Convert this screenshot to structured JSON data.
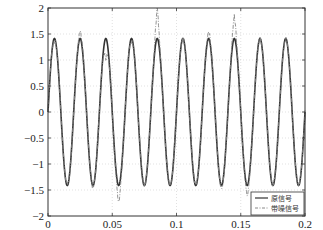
{
  "chart_data": {
    "type": "line",
    "title": "",
    "xlabel": "",
    "ylabel": "",
    "xlim": [
      0,
      0.2
    ],
    "ylim": [
      -2,
      2
    ],
    "grid": true,
    "legend_position": "lower right",
    "xticks": [
      "0",
      "0.05",
      "0.1",
      "0.15",
      "0.2"
    ],
    "yticks": [
      "2",
      "1.5",
      "1",
      "0.5",
      "0",
      "-0.5",
      "-1",
      "-1.5",
      "-2"
    ],
    "series": [
      {
        "name": "原信号",
        "style": "solid",
        "color": "#333333",
        "description": "sine wave, amplitude ~1.414, frequency 50 Hz",
        "amplitude": 1.414,
        "frequency_hz": 50,
        "x": [
          0,
          0.005,
          0.01,
          0.015,
          0.02,
          0.025,
          0.03,
          0.035,
          0.04,
          0.045,
          0.05,
          0.055,
          0.06,
          0.065,
          0.07,
          0.075,
          0.08,
          0.085,
          0.09,
          0.095,
          0.1,
          0.105,
          0.11,
          0.115,
          0.12,
          0.125,
          0.13,
          0.135,
          0.14,
          0.145,
          0.15,
          0.155,
          0.16,
          0.165,
          0.17,
          0.175,
          0.18,
          0.185,
          0.19,
          0.195,
          0.2
        ],
        "values": [
          0,
          1.41,
          0,
          -1.41,
          0,
          1.41,
          0,
          -1.41,
          0,
          1.41,
          0,
          -1.41,
          0,
          1.41,
          0,
          -1.41,
          0,
          1.41,
          0,
          -1.41,
          0,
          1.41,
          0,
          -1.41,
          0,
          1.41,
          0,
          -1.41,
          0,
          1.41,
          0,
          -1.41,
          0,
          1.41,
          0,
          -1.41,
          0,
          1.41,
          0,
          -1.41,
          0
        ]
      },
      {
        "name": "带噪信号",
        "style": "dash-dot",
        "color": "#888888",
        "description": "sine wave with noise and occasional spikes",
        "x": [
          0,
          0.005,
          0.01,
          0.015,
          0.02,
          0.025,
          0.03,
          0.035,
          0.04,
          0.045,
          0.05,
          0.055,
          0.06,
          0.065,
          0.07,
          0.075,
          0.08,
          0.085,
          0.09,
          0.095,
          0.1,
          0.105,
          0.11,
          0.115,
          0.12,
          0.125,
          0.13,
          0.135,
          0.14,
          0.145,
          0.15,
          0.155,
          0.16,
          0.165,
          0.17,
          0.175,
          0.18,
          0.185,
          0.19,
          0.195,
          0.2
        ],
        "values": [
          0.05,
          1.35,
          0.1,
          -1.38,
          -0.05,
          1.55,
          0.2,
          -1.45,
          0.1,
          1.0,
          -0.05,
          -1.75,
          0.1,
          1.35,
          0.15,
          -1.4,
          0.05,
          2.0,
          -0.1,
          -1.4,
          0.05,
          1.4,
          0.1,
          -1.35,
          0.0,
          1.55,
          0.1,
          -1.45,
          -0.05,
          1.85,
          0.1,
          -1.6,
          0.0,
          1.4,
          0.1,
          -1.4,
          0.05,
          1.4,
          0.0,
          -1.4,
          0.05
        ]
      }
    ]
  },
  "legend": {
    "items": [
      {
        "label": "原信号"
      },
      {
        "label": "带噪信号"
      }
    ]
  }
}
